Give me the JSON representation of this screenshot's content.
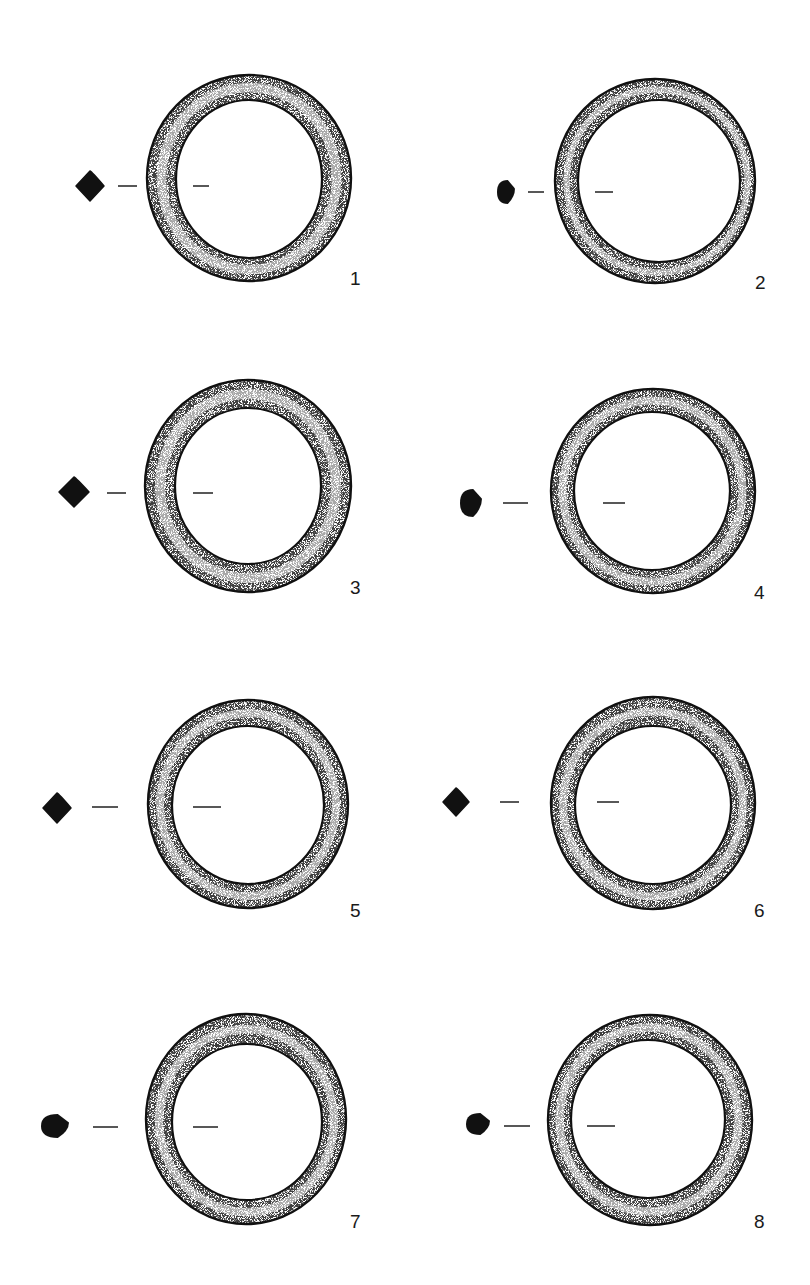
{
  "figure": {
    "ink_color": "#111111",
    "stipple_color": "#333333",
    "background": "#ffffff"
  },
  "rings": [
    {
      "number": "1",
      "section": "rhombic",
      "outer": {
        "cx": 249,
        "cy": 178,
        "rx": 102,
        "ry": 103
      },
      "inner": {
        "cx": 249,
        "cy": 179,
        "rx": 73,
        "ry": 79
      },
      "profile": {
        "x": 90,
        "y": 186,
        "w": 28,
        "h": 30
      },
      "dashes": [
        [
          118,
          137,
          186
        ],
        [
          193,
          209,
          186
        ]
      ],
      "label_pos": [
        350,
        283
      ]
    },
    {
      "number": "2",
      "section": "rounded-oval",
      "outer": {
        "cx": 655,
        "cy": 181,
        "rx": 100,
        "ry": 102
      },
      "inner": {
        "cx": 659,
        "cy": 181,
        "rx": 81,
        "ry": 81
      },
      "profile": {
        "x": 506,
        "y": 192,
        "w": 18,
        "h": 24
      },
      "dashes": [
        [
          528,
          544,
          192
        ],
        [
          595,
          613,
          192
        ]
      ],
      "label_pos": [
        755,
        287
      ]
    },
    {
      "number": "3",
      "section": "rhombic",
      "outer": {
        "cx": 248,
        "cy": 486,
        "rx": 103,
        "ry": 106
      },
      "inner": {
        "cx": 248,
        "cy": 486,
        "rx": 73,
        "ry": 78
      },
      "profile": {
        "x": 74,
        "y": 492,
        "w": 30,
        "h": 30
      },
      "dashes": [
        [
          107,
          126,
          493
        ],
        [
          193,
          213,
          493
        ]
      ],
      "label_pos": [
        350,
        592
      ]
    },
    {
      "number": "4",
      "section": "rounded-oval",
      "outer": {
        "cx": 653,
        "cy": 491,
        "rx": 102,
        "ry": 102
      },
      "inner": {
        "cx": 652,
        "cy": 491,
        "rx": 78,
        "ry": 79
      },
      "profile": {
        "x": 471,
        "y": 503,
        "w": 22,
        "h": 28
      },
      "dashes": [
        [
          503,
          528,
          503
        ],
        [
          603,
          625,
          503
        ]
      ],
      "label_pos": [
        754,
        597
      ]
    },
    {
      "number": "5",
      "section": "rhombic",
      "outer": {
        "cx": 248,
        "cy": 804,
        "rx": 100,
        "ry": 104
      },
      "inner": {
        "cx": 248,
        "cy": 805,
        "rx": 76,
        "ry": 79
      },
      "profile": {
        "x": 57,
        "y": 808,
        "w": 28,
        "h": 30
      },
      "dashes": [
        [
          92,
          118,
          807
        ],
        [
          193,
          221,
          807
        ]
      ],
      "label_pos": [
        350,
        915
      ]
    },
    {
      "number": "6",
      "section": "rhombic",
      "outer": {
        "cx": 653,
        "cy": 803,
        "rx": 102,
        "ry": 106
      },
      "inner": {
        "cx": 653,
        "cy": 805,
        "rx": 78,
        "ry": 79
      },
      "profile": {
        "x": 456,
        "y": 802,
        "w": 26,
        "h": 28
      },
      "dashes": [
        [
          500,
          519,
          802
        ],
        [
          597,
          619,
          802
        ]
      ],
      "label_pos": [
        754,
        915
      ]
    },
    {
      "number": "7",
      "section": "rounded-oval",
      "outer": {
        "cx": 246,
        "cy": 1119,
        "rx": 100,
        "ry": 105
      },
      "inner": {
        "cx": 247,
        "cy": 1122,
        "rx": 75,
        "ry": 78
      },
      "profile": {
        "x": 55,
        "y": 1126,
        "w": 28,
        "h": 24
      },
      "dashes": [
        [
          93,
          118,
          1127
        ],
        [
          193,
          218,
          1127
        ]
      ],
      "label_pos": [
        350,
        1226
      ]
    },
    {
      "number": "8",
      "section": "rounded-oval",
      "outer": {
        "cx": 650,
        "cy": 1120,
        "rx": 102,
        "ry": 105
      },
      "inner": {
        "cx": 648,
        "cy": 1119,
        "rx": 77,
        "ry": 79
      },
      "profile": {
        "x": 478,
        "y": 1124,
        "w": 24,
        "h": 22
      },
      "dashes": [
        [
          504,
          530,
          1126
        ],
        [
          587,
          615,
          1126
        ]
      ],
      "label_pos": [
        754,
        1226
      ]
    }
  ]
}
